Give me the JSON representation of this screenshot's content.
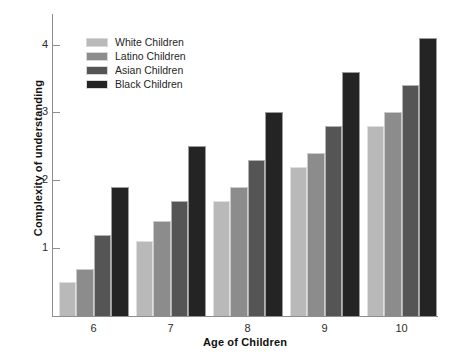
{
  "chart_data": {
    "type": "bar",
    "title": "",
    "xlabel": "Age of Children",
    "ylabel": "Complexity of understanding",
    "categories": [
      "6",
      "7",
      "8",
      "9",
      "10"
    ],
    "ylim": [
      0,
      4.45
    ],
    "yticks": [
      1,
      2,
      3,
      4
    ],
    "ytick_labels": [
      "1",
      "2",
      "3",
      "4"
    ],
    "grid": false,
    "legend_position": "top-left",
    "series": [
      {
        "name": "White Children",
        "color": "#b9b9b9",
        "values": [
          0.5,
          1.1,
          1.7,
          2.2,
          2.8
        ]
      },
      {
        "name": "Latino Children",
        "color": "#8c8c8c",
        "values": [
          0.7,
          1.4,
          1.9,
          2.4,
          3.0
        ]
      },
      {
        "name": "Asian Children",
        "color": "#555555",
        "values": [
          1.2,
          1.7,
          2.3,
          2.8,
          3.4
        ]
      },
      {
        "name": "Black Children",
        "color": "#242424",
        "values": [
          1.9,
          2.5,
          3.0,
          3.6,
          4.1
        ]
      }
    ]
  }
}
